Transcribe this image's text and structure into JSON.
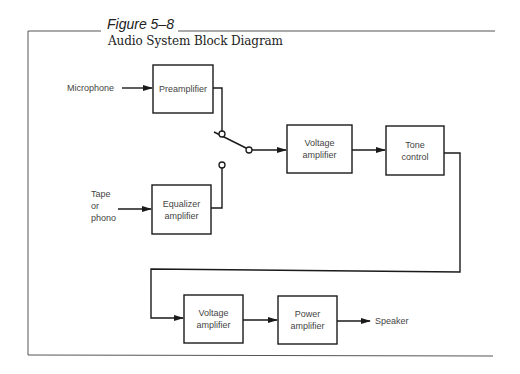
{
  "figure": {
    "number": "Figure 5–8",
    "title": "Audio System Block Diagram"
  },
  "inputs": {
    "microphone": "Microphone",
    "tape_line1": "Tape",
    "tape_line2": "or",
    "tape_line3": "phono"
  },
  "blocks": {
    "preamplifier": "Preamplifier",
    "equalizer_line1": "Equalizer",
    "equalizer_line2": "amplifier",
    "voltage_amp1_line1": "Voltage",
    "voltage_amp1_line2": "amplifier",
    "tone_line1": "Tone",
    "tone_line2": "control",
    "voltage_amp2_line1": "Voltage",
    "voltage_amp2_line2": "amplifier",
    "power_line1": "Power",
    "power_line2": "amplifier"
  },
  "outputs": {
    "speaker": "Speaker"
  },
  "colors": {
    "line": "#1a1a1a",
    "frame": "#333333",
    "text": "#444444"
  }
}
